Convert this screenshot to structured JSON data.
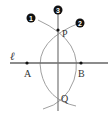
{
  "diagram": {
    "line_label": "ℓ",
    "points": {
      "A": "A",
      "B": "B",
      "P": "P",
      "Q": "Q"
    },
    "steps": [
      "1",
      "2",
      "3"
    ],
    "colors": {
      "line": "#666666",
      "arc": "#999999",
      "point": "#111111",
      "badge": "#111111"
    }
  }
}
